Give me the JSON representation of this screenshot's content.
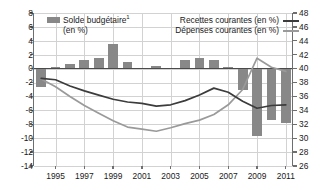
{
  "legend": {
    "bar_label_line1": "Solde budgétaire",
    "bar_label_sup": "1",
    "bar_label_line2": "(en %)",
    "recettes_label": "Recettes courantes (en %)",
    "depenses_label": "Dépenses courantes (en %)",
    "bar_color": "#888888",
    "recettes_color": "#3c3c3c",
    "depenses_color": "#9a9a9a"
  },
  "chart_data": {
    "type": "bar",
    "title": "",
    "xlabel": "",
    "ylabel": "",
    "grid": true,
    "legend_position": "top",
    "x": [
      1994,
      1995,
      1996,
      1997,
      1998,
      1999,
      2000,
      2001,
      2002,
      2003,
      2004,
      2005,
      2006,
      2007,
      2008,
      2009,
      2010,
      2011
    ],
    "tick_labels_x": [
      "1995",
      "1997",
      "1999",
      "2001",
      "2003",
      "2005",
      "2007",
      "2009",
      "2011"
    ],
    "left_axis": {
      "label": "",
      "ylim": [
        -14,
        8
      ],
      "ticks": [
        8,
        6,
        4,
        2,
        0,
        -2,
        -4,
        -6,
        -8,
        -10,
        -12,
        -14
      ],
      "tick_labels": [
        "8",
        "6",
        "4",
        "2",
        "0",
        "-2",
        "-4",
        "-6",
        "-8",
        "-10",
        "-12",
        "-14"
      ]
    },
    "right_axis": {
      "label": "",
      "ylim": [
        26,
        48
      ],
      "ticks": [
        48,
        46,
        44,
        42,
        40,
        38,
        36,
        34,
        32,
        30,
        28,
        26
      ],
      "tick_labels": [
        "48",
        "46",
        "44",
        "42",
        "40",
        "38",
        "36",
        "34",
        "32",
        "30",
        "28",
        "26"
      ]
    },
    "series": [
      {
        "name": "Solde budgétaire",
        "type": "bar",
        "axis": "left",
        "color": "#888888",
        "values": [
          -2.6,
          0.3,
          0.6,
          1.3,
          1.5,
          3.5,
          0.9,
          0.1,
          0.4,
          0.1,
          1.3,
          1.5,
          1.2,
          0.3,
          -3.1,
          -9.7,
          -7.4,
          -7.8
        ]
      },
      {
        "name": "Recettes courantes (en %)",
        "type": "line",
        "axis": "right",
        "color": "#3c3c3c",
        "values": [
          38.6,
          38.4,
          37.5,
          36.8,
          36.2,
          35.6,
          35.2,
          35.0,
          34.6,
          34.8,
          35.4,
          36.2,
          37.2,
          36.6,
          35.3,
          34.3,
          34.7,
          34.8
        ]
      },
      {
        "name": "Dépenses courantes (en %)",
        "type": "line",
        "axis": "right",
        "color": "#9a9a9a",
        "values": [
          38.5,
          37.4,
          36.0,
          34.7,
          33.6,
          32.5,
          31.6,
          31.3,
          31.0,
          31.5,
          32.1,
          32.6,
          33.4,
          34.8,
          37.0,
          41.5,
          40.2,
          39.6
        ]
      }
    ]
  }
}
